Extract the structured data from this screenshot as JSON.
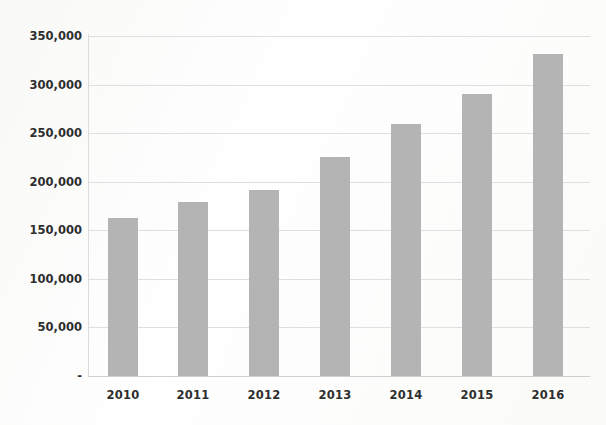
{
  "chart_data": {
    "type": "bar",
    "title": "",
    "subtitle": "",
    "xlabel": "",
    "ylabel": "",
    "categories": [
      "2010",
      "2011",
      "2012",
      "2013",
      "2014",
      "2015",
      "2016"
    ],
    "values": [
      163000,
      179000,
      192000,
      225000,
      259000,
      290000,
      332000
    ],
    "series": [
      {
        "name": "",
        "values": [
          163000,
          179000,
          192000,
          225000,
          259000,
          290000,
          332000
        ]
      }
    ],
    "ylim": [
      0,
      350000
    ],
    "y_ticks": [
      0,
      50000,
      100000,
      150000,
      200000,
      250000,
      300000,
      350000
    ],
    "y_tick_labels": [
      "-",
      "50,000",
      "100,000",
      "150,000",
      "200,000",
      "250,000",
      "300,000",
      "350,000"
    ],
    "grid": true,
    "legend": "none",
    "bar_color": "#b4b4b4",
    "gridline_color": "#d9d9d9",
    "axis_color": "#cfcfcf",
    "text_color": "#2e2e2e",
    "background_color": "#fdfdfd"
  },
  "axes": {
    "y_labels": [
      {
        "text": "350,000",
        "value": 350000
      },
      {
        "text": "300,000",
        "value": 300000
      },
      {
        "text": "250,000",
        "value": 250000
      },
      {
        "text": "200,000",
        "value": 200000
      },
      {
        "text": "150,000",
        "value": 150000
      },
      {
        "text": "100,000",
        "value": 100000
      },
      {
        "text": "50,000",
        "value": 50000
      },
      {
        "text": "-",
        "value": 0
      }
    ],
    "x_labels": [
      "2010",
      "2011",
      "2012",
      "2013",
      "2014",
      "2015",
      "2016"
    ]
  }
}
